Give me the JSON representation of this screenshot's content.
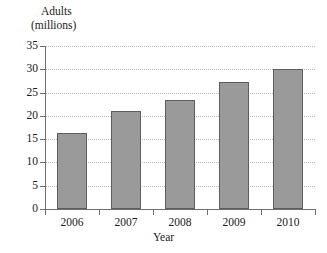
{
  "chart_data": {
    "type": "bar",
    "title": "",
    "xlabel": "Year",
    "ylabel": "Adults (millions)",
    "ylabel_line1": "Adults",
    "ylabel_line2": "(millions)",
    "categories": [
      "2006",
      "2007",
      "2008",
      "2009",
      "2010"
    ],
    "values": [
      16.4,
      21.1,
      23.4,
      27.2,
      30.1
    ],
    "ylim": [
      0,
      35
    ],
    "yticks": [
      0,
      5,
      10,
      15,
      20,
      25,
      30,
      35
    ],
    "ytick_labels": [
      "0",
      "5",
      "10",
      "15",
      "20",
      "25",
      "30",
      "35"
    ],
    "grid": "horizontal-dotted",
    "legend": "none",
    "bar_color": "#9a9a9a",
    "bar_edge_color": "#5d5d5d",
    "axis_color": "#6e6e6e",
    "gridline_color": "#b9b9b9",
    "background": "#ffffff"
  },
  "axes": {
    "y_title_line1": "Adults",
    "y_title_line2": "(millions)",
    "x_title": "Year"
  }
}
